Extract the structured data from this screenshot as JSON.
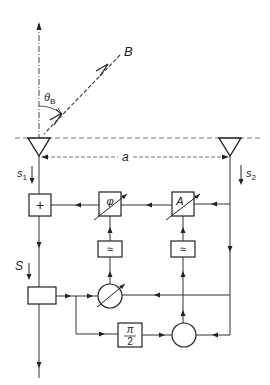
{
  "diagram": {
    "labels": {
      "beam": "B",
      "angle": "θ",
      "angle_sub": "B",
      "spacing": "a",
      "signal1": "s",
      "signal1_sub": "1",
      "signal2": "s",
      "signal2_sub": "2",
      "sum_output": "S"
    },
    "blocks": {
      "adder": "+",
      "phase_shifter": "φ",
      "amplitude": "A",
      "lowpass_left": "≈",
      "lowpass_right": "≈",
      "quarter_shift_num": "π",
      "quarter_shift_den": "2"
    },
    "colors": {
      "line": "#333333",
      "dashed": "#666666",
      "background": "#ffffff"
    }
  }
}
